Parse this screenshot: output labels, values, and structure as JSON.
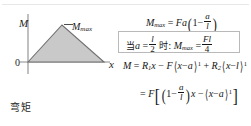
{
  "figure": {
    "caption_cn": "弯矩",
    "diagram": {
      "y_axis_label": "M",
      "x_axis_label": "x",
      "origin_label": "0",
      "peak_label": "M",
      "peak_label_sub": "max",
      "fill_color": "#c8c8c8",
      "stroke_color": "#6e6e6e"
    }
  },
  "equations": {
    "eq_max": {
      "lhs": "M",
      "lhs_sub": "max",
      "eq": "=",
      "Fa": "Fa",
      "one": "1",
      "minus": "−",
      "frac_num": "a",
      "frac_den": "l"
    },
    "eq_boxed": {
      "when_cn": "当",
      "a": "a",
      "eq1": "=",
      "half_num": "l",
      "half_den": "2",
      "shi_cn": "时:",
      "M": "M",
      "M_sub": "max",
      "eq2": "=",
      "res_num": "Fl",
      "res_den": "4"
    },
    "eq_general": {
      "M": "M",
      "eq": "=",
      "R1": "R",
      "R1_sub": "1",
      "x1": "x",
      "minus": "−",
      "F": "F",
      "term1_x": "x",
      "term1_minus": "−",
      "term1_a": "a",
      "term1_pow": "1",
      "plus": "+",
      "R2": "R",
      "R2_sub": "2",
      "term2_x": "x",
      "term2_minus": "−",
      "term2_l": "l",
      "term2_pow": "1"
    },
    "eq_final": {
      "eq": "=",
      "F": "F",
      "one": "1",
      "minus1": "−",
      "frac_num": "a",
      "frac_den": "l",
      "x": "x",
      "minus2": "−",
      "term_x": "x",
      "term_minus": "−",
      "term_a": "a",
      "term_pow": "1"
    }
  }
}
